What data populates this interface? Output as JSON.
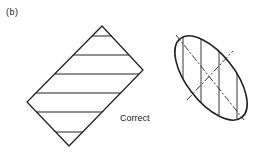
{
  "figure": {
    "panel_label": "(b)",
    "caption": "Correct",
    "stroke_color": "#222222",
    "rectangle": {
      "description": "Rotated rectangle section with horizontal hatch lines",
      "vertices": [
        [
          102,
          26
        ],
        [
          143,
          70
        ],
        [
          69,
          146
        ],
        [
          27,
          102
        ]
      ],
      "hatch_y": [
        36,
        55,
        74,
        93,
        112,
        132
      ]
    },
    "ellipse": {
      "description": "Tilted elliptical section with vertical hatch lines and dashed center lines",
      "center": [
        211,
        78
      ],
      "rx": 50,
      "ry": 24,
      "rotation_deg": 52,
      "hatch_x": [
        183,
        201,
        219,
        237
      ],
      "major_axis_dash": [
        [
          176,
          35
        ],
        [
          244,
          120
        ]
      ],
      "minor_axis_dash": [
        [
          187,
          100
        ],
        [
          233,
          51
        ]
      ]
    }
  }
}
